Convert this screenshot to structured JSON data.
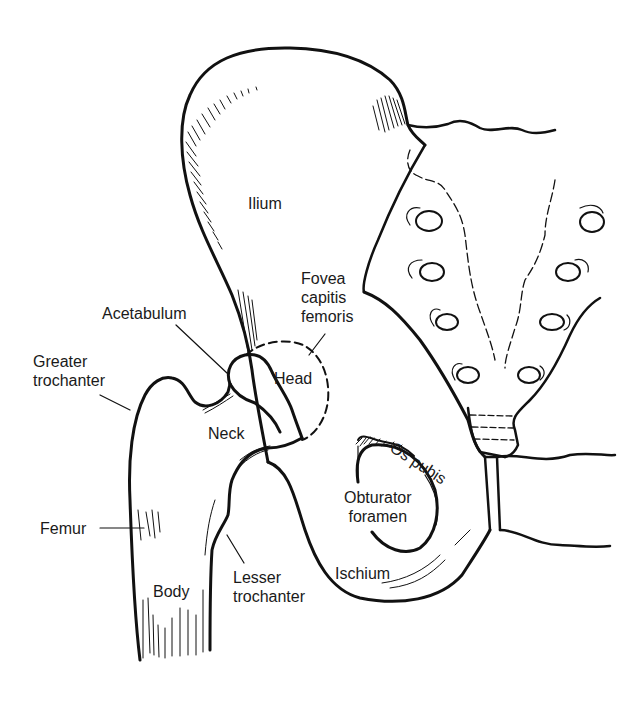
{
  "diagram": {
    "style": "black line illustration on white background",
    "colors": {
      "ink": "#111111",
      "background": "#ffffff",
      "label": "#1a1a1a"
    },
    "labels": {
      "ilium": "Ilium",
      "fovea": "Fovea\ncapitis\nfemoris",
      "acetabulum": "Acetabulum",
      "greater_trochanter": "Greater\ntrochanter",
      "head": "Head",
      "neck": "Neck",
      "femur": "Femur",
      "body": "Body",
      "lesser_trochanter": "Lesser\ntrochanter",
      "os_pubis": "Os pubis",
      "obturator_foramen": "Obturator\nforamen",
      "ischium": "Ischium"
    },
    "structures": [
      "ilium",
      "sacrum",
      "acetabulum",
      "femoral-head",
      "femoral-neck",
      "greater-trochanter",
      "lesser-trochanter",
      "femur-body",
      "os-pubis",
      "obturator-foramen",
      "ischium",
      "pubic-symphysis"
    ]
  }
}
